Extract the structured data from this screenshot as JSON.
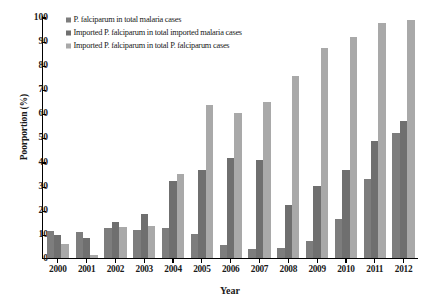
{
  "chart_data": {
    "type": "bar",
    "title": "",
    "xlabel": "Year",
    "ylabel": "Poorportion (%)",
    "ylim": [
      0,
      100
    ],
    "ytick_step": 10,
    "yticks": [
      100,
      90,
      80,
      70,
      60,
      50,
      40,
      30,
      20,
      10,
      0
    ],
    "grid": false,
    "legend_position": "top-left-inside",
    "categories": [
      "2000",
      "2001",
      "2002",
      "2003",
      "2004",
      "2005",
      "2006",
      "2007",
      "2008",
      "2009",
      "2010",
      "2011",
      "2012"
    ],
    "series": [
      {
        "name": "P. falciparum in total malaria cases",
        "color": "#7d7d7d",
        "values": [
          11.0,
          10.4,
          12.2,
          11.4,
          12.4,
          9.6,
          5.2,
          3.4,
          3.8,
          7.0,
          15.9,
          32.7,
          51.6
        ]
      },
      {
        "name": "Imported P. falciparum in total imported malaria cases",
        "color": "#6f6f6f",
        "values": [
          9.4,
          8.0,
          14.8,
          18.0,
          31.9,
          36.2,
          41.2,
          40.5,
          21.7,
          29.5,
          36.2,
          48.3,
          56.5
        ]
      },
      {
        "name": "Imported P. falciparum in total P. falciparum cases",
        "color": "#a9a9a9",
        "values": [
          5.6,
          0.9,
          12.6,
          13.0,
          34.6,
          63.0,
          59.9,
          64.6,
          75.0,
          86.6,
          91.5,
          97.0,
          98.5
        ]
      }
    ]
  }
}
